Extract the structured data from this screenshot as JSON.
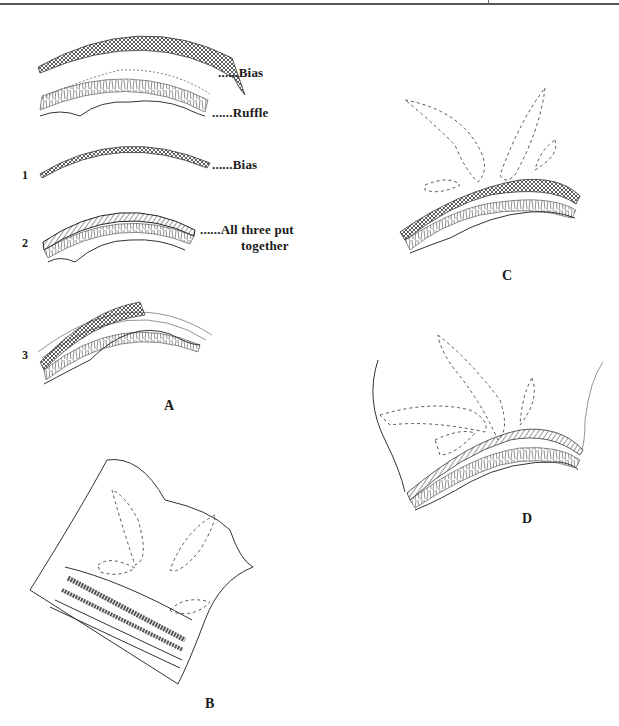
{
  "page": {
    "figure_A": {
      "letter": "A",
      "step_labels": [
        {
          "text": "......Bias",
          "target": "bias strip (top)"
        },
        {
          "text": "......Ruffle",
          "target": "ruffle strip"
        },
        {
          "text": "......Bias",
          "target": "bias strip (second)"
        },
        {
          "text": "......All three put",
          "line2": "together",
          "target": "combined layers"
        }
      ],
      "step_numbers": [
        "1",
        "2",
        "3"
      ]
    },
    "figure_B": {
      "letter": "B"
    },
    "figure_C": {
      "letter": "C"
    },
    "figure_D": {
      "letter": "D"
    }
  }
}
